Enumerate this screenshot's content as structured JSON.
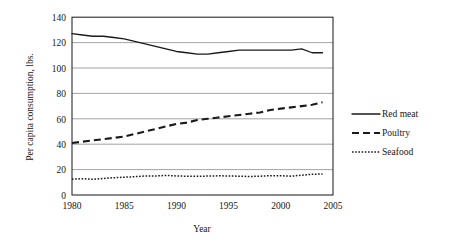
{
  "chart_data": {
    "type": "line",
    "title": "",
    "xlabel": "Year",
    "ylabel": "Per capita consumption, lbs.",
    "xlim": [
      1980,
      2005
    ],
    "ylim": [
      0,
      140
    ],
    "grid": "horizontal",
    "legend_position": "right",
    "x_ticks": [
      "1980",
      "1985",
      "1990",
      "1995",
      "2000",
      "2005"
    ],
    "y_ticks": [
      "0",
      "20",
      "40",
      "60",
      "80",
      "100",
      "120",
      "140"
    ],
    "x": [
      1980,
      1981,
      1982,
      1983,
      1984,
      1985,
      1986,
      1987,
      1988,
      1989,
      1990,
      1991,
      1992,
      1993,
      1994,
      1995,
      1996,
      1997,
      1998,
      1999,
      2000,
      2001,
      2002,
      2003,
      2004
    ],
    "series": [
      {
        "name": "Red meat",
        "style": "solid",
        "values": [
          127,
          126,
          125,
          125,
          124,
          123,
          121,
          119,
          117,
          115,
          113,
          112,
          111,
          111,
          112,
          113,
          114,
          114,
          114,
          114,
          114,
          114,
          115,
          112,
          112
        ]
      },
      {
        "name": "Poultry",
        "style": "dashed",
        "values": [
          41,
          42,
          43,
          44,
          45,
          46,
          48,
          50,
          52,
          54,
          56,
          57,
          59,
          60,
          61,
          62,
          63,
          64,
          65,
          67,
          68,
          69,
          70,
          71,
          73
        ]
      },
      {
        "name": "Seafood",
        "style": "dotted",
        "values": [
          12.5,
          12.8,
          12.4,
          13.0,
          13.6,
          14.0,
          14.4,
          15.0,
          15.0,
          15.4,
          15.0,
          14.8,
          14.7,
          14.9,
          15.1,
          15.0,
          14.8,
          14.6,
          14.8,
          15.2,
          15.2,
          14.8,
          15.6,
          16.3,
          16.6
        ]
      }
    ]
  },
  "legend": {
    "items": [
      {
        "label": "Red meat"
      },
      {
        "label": "Poultry"
      },
      {
        "label": "Seafood"
      }
    ]
  }
}
